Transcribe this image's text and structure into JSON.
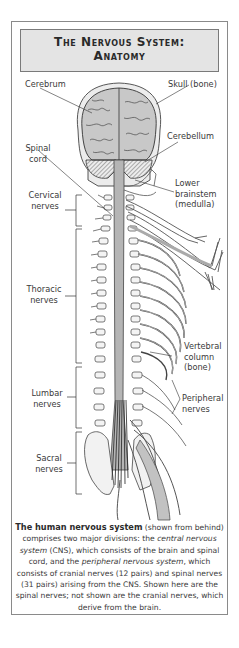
{
  "title": {
    "line1": "The Nervous System:",
    "line2": "Anatomy"
  },
  "labels": {
    "cerebrum": "Cerebrum",
    "skull": "Skull (bone)",
    "cerebellum": "Cerebellum",
    "spinal_cord_1": "Spinal",
    "spinal_cord_2": "cord",
    "lower_brainstem_1": "Lower",
    "lower_brainstem_2": "brainstem",
    "lower_brainstem_3": "(medulla)",
    "cervical_1": "Cervical",
    "cervical_2": "nerves",
    "thoracic_1": "Thoracic",
    "thoracic_2": "nerves",
    "vertebral_1": "Vertebral",
    "vertebral_2": "column",
    "vertebral_3": "(bone)",
    "lumbar_1": "Lumbar",
    "lumbar_2": "nerves",
    "peripheral_1": "Peripheral",
    "peripheral_2": "nerves",
    "sacral_1": "Sacral",
    "sacral_2": "nerves"
  },
  "caption": {
    "bold_lead": "The human nervous system",
    "t1": " (shown from behind) comprises two major divisions: the ",
    "italic1": "central nervous system",
    "t2": " (CNS), which consists of the brain and spinal cord, and the ",
    "italic2": "peripheral nervous system",
    "t3": ", which consists of cranial nerves (12 pairs) and spinal nerves (31 pairs) arising from the CNS. Shown here are the spinal nerves; not shown are the cranial nerves, which derive from the brain."
  },
  "colors": {
    "title_bg": "#e4e4e4",
    "frame_border": "#8a8a8a",
    "brain_fill": "#c8c8c8",
    "cord_fill": "#b5b5b5",
    "line": "#3a3a3a"
  }
}
